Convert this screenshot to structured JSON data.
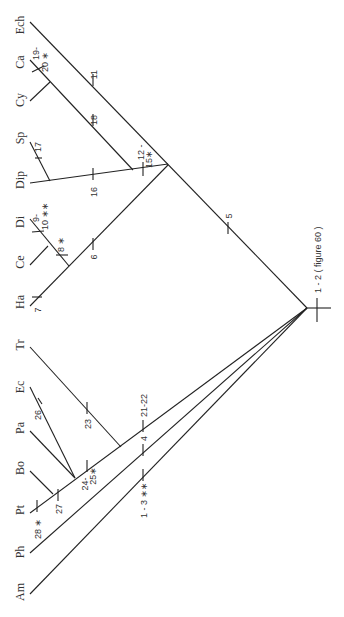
{
  "diagram": {
    "type": "cladogram",
    "orientation": "rotated-90-ccw",
    "taxa": [
      {
        "id": "ech",
        "label": "Ech",
        "y": 25
      },
      {
        "id": "ca",
        "label": "Ca",
        "y": 62
      },
      {
        "id": "cy",
        "label": "Cy",
        "y": 100
      },
      {
        "id": "sp",
        "label": "Sp",
        "y": 138
      },
      {
        "id": "dip",
        "label": "Dip",
        "y": 180
      },
      {
        "id": "di",
        "label": "Di",
        "y": 222
      },
      {
        "id": "ce",
        "label": "Ce",
        "y": 262
      },
      {
        "id": "ha",
        "label": "Ha",
        "y": 302
      },
      {
        "id": "tr",
        "label": "Tr",
        "y": 345
      },
      {
        "id": "ec",
        "label": "Ec",
        "y": 387
      },
      {
        "id": "pa",
        "label": "Pa",
        "y": 428
      },
      {
        "id": "bo",
        "label": "Bo",
        "y": 468
      },
      {
        "id": "pt",
        "label": "Pt",
        "y": 510
      },
      {
        "id": "ph",
        "label": "Ph",
        "y": 552
      },
      {
        "id": "am",
        "label": "Am",
        "y": 592
      }
    ],
    "characters": {
      "c19_20": "19-",
      "c19_20b": "20 ∗",
      "c11": "11",
      "c18": "18",
      "c17": "17",
      "c16": "16",
      "c12_15": "12 -",
      "c12_15b": "15∗",
      "c9_10": "9-",
      "c9_10b": "10 ∗∗",
      "c8": "8 ∗",
      "c6": "6",
      "c5": "5",
      "c7": "7",
      "c26": "26",
      "c23": "23",
      "c21_22": "21-22",
      "c4": "4",
      "c1_3": "1 - 3 ∗∗",
      "c24_25": "24-",
      "c24_25b": "25∗",
      "c27": "27",
      "c28": "28 ∗",
      "root_note": "1 - 2 ( figure 60 )"
    }
  }
}
